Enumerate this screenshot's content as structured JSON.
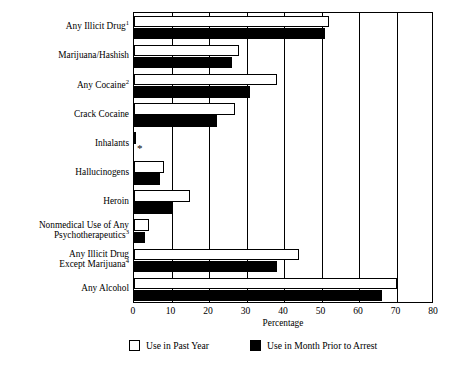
{
  "chart_data": {
    "type": "bar",
    "orientation": "horizontal",
    "title": "",
    "xlabel": "Percentage",
    "ylabel": "",
    "xlim": [
      0,
      80
    ],
    "xticks": [
      0,
      10,
      20,
      30,
      40,
      50,
      60,
      70,
      80
    ],
    "grid": "vertical",
    "legend_position": "bottom",
    "categories": [
      "Any Illicit Drug",
      "Marijuana/Hashish",
      "Any Cocaine",
      "Crack Cocaine",
      "Inhalants",
      "Hallucinogens",
      "Heroin",
      "Nonmedical Use of Any\nPsychotherapeutics",
      "Any Illicit Drug\nExcept Marijuana",
      "Any Alcohol"
    ],
    "category_footnotes": [
      "1",
      "",
      "2",
      "",
      "",
      "",
      "",
      "3",
      "4",
      ""
    ],
    "series": [
      {
        "name": "Use in Past Year",
        "color": "#ffffff",
        "edge_color": "#000000",
        "values": [
          52,
          28,
          38,
          27,
          0.5,
          8,
          15,
          4,
          44,
          70
        ]
      },
      {
        "name": "Use in Month Prior to Arrest",
        "color": "#000000",
        "edge_color": "#000000",
        "values": [
          51,
          26,
          31,
          22,
          null,
          7,
          10,
          3,
          38,
          66
        ],
        "suppressed_marker": "*",
        "suppressed_indices": [
          4
        ]
      }
    ]
  },
  "legend": {
    "entries": [
      {
        "label": "Use in Past Year",
        "swatch": "white"
      },
      {
        "label": "Use in Month Prior to Arrest",
        "swatch": "black"
      }
    ]
  },
  "axis": {
    "x_title": "Percentage",
    "tick_labels": [
      "0",
      "10",
      "20",
      "30",
      "40",
      "50",
      "60",
      "70",
      "80"
    ]
  }
}
